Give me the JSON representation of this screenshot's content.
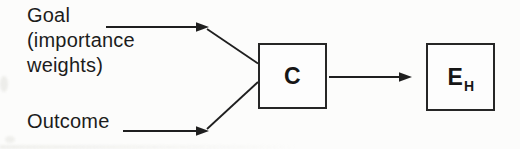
{
  "diagram": {
    "goal_label": "Goal\n(importance\nweights)",
    "outcome_label": "Outcome",
    "c_node": {
      "label": "C"
    },
    "eh_node": {
      "label_main": "E",
      "label_sub": "H"
    },
    "edges": [
      {
        "from": "Goal (importance weights)",
        "to": "C"
      },
      {
        "from": "Outcome",
        "to": "C"
      },
      {
        "from": "C",
        "to": "EH"
      }
    ],
    "colors": {
      "line": "#1f1f1f",
      "box_border": "#262626",
      "box_fill": "#fdfdfd",
      "text": "#1c1c1c",
      "background": "#fcfcfb"
    }
  }
}
